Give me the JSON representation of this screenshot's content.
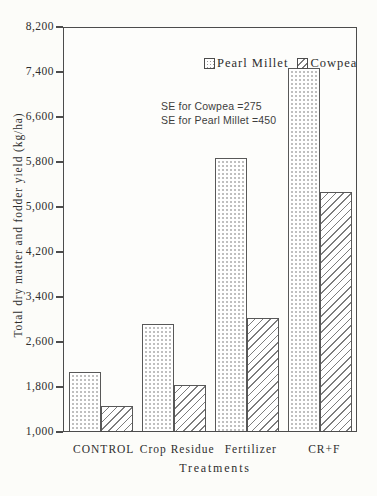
{
  "chart_data": {
    "type": "bar",
    "categories": [
      "CONTROL",
      "Crop Residue",
      "Fertilizer",
      "CR+F"
    ],
    "series": [
      {
        "name": "Pearl Millet",
        "pattern": "dots",
        "values": [
          2050,
          2900,
          5850,
          7450
        ]
      },
      {
        "name": "Cowpea",
        "pattern": "hatch",
        "values": [
          1450,
          1820,
          3000,
          5250
        ]
      }
    ],
    "title": "",
    "xlabel": "Treatments",
    "ylabel": "Total dry matter and fodder yield (kg/ha)",
    "ylim": [
      1000,
      8200
    ],
    "ytick_step": 800,
    "yticks": [
      "8,200",
      "7,400",
      "6,600",
      "5,800",
      "5,000",
      "4,200",
      "3,400",
      "2,600",
      "1,800",
      "1,000"
    ],
    "grid": false,
    "legend_position": "top-center"
  },
  "annotations": {
    "se_cowpea": "SE for Cowpea =275",
    "se_pearl_millet": "SE for Pearl Millet =450"
  },
  "colors": {
    "paper": "#fcfcf9",
    "axis": "#4c4c4c",
    "bar_outline": "#585858",
    "hatch_line": "#7d7d7d",
    "dot": "#9c9c9c",
    "text": "#2e2e2e"
  }
}
